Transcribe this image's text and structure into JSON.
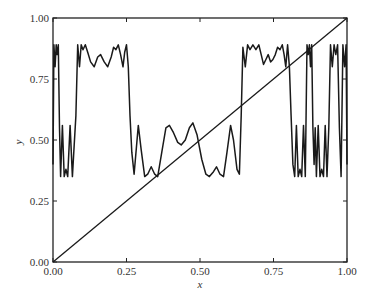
{
  "chart_data": {
    "type": "line",
    "title": "",
    "xlabel": "x",
    "ylabel": "y",
    "xlim": [
      0,
      1
    ],
    "ylim": [
      0,
      1
    ],
    "grid": false,
    "legend": null,
    "x_ticks": [
      "0.00",
      "0.25",
      "0.50",
      "0.75",
      "1.00"
    ],
    "y_ticks": [
      "0.00",
      "0.25",
      "0.50",
      "0.75",
      "1.00"
    ],
    "series": [
      {
        "name": "diagonal y = x",
        "points": [
          [
            0,
            0
          ],
          [
            1,
            1
          ]
        ]
      },
      {
        "name": "oscillating map (Fourier partial sum)",
        "points": [
          [
            0.0,
            0.4
          ],
          [
            0.003,
            0.89
          ],
          [
            0.007,
            0.8
          ],
          [
            0.011,
            0.89
          ],
          [
            0.014,
            0.85
          ],
          [
            0.018,
            0.89
          ],
          [
            0.022,
            0.55
          ],
          [
            0.026,
            0.35
          ],
          [
            0.032,
            0.56
          ],
          [
            0.038,
            0.35
          ],
          [
            0.044,
            0.38
          ],
          [
            0.05,
            0.35
          ],
          [
            0.058,
            0.56
          ],
          [
            0.066,
            0.35
          ],
          [
            0.072,
            0.48
          ],
          [
            0.078,
            0.6
          ],
          [
            0.084,
            0.89
          ],
          [
            0.09,
            0.8
          ],
          [
            0.096,
            0.89
          ],
          [
            0.102,
            0.87
          ],
          [
            0.11,
            0.89
          ],
          [
            0.118,
            0.86
          ],
          [
            0.128,
            0.82
          ],
          [
            0.14,
            0.8
          ],
          [
            0.152,
            0.84
          ],
          [
            0.162,
            0.85
          ],
          [
            0.174,
            0.82
          ],
          [
            0.186,
            0.8
          ],
          [
            0.198,
            0.84
          ],
          [
            0.206,
            0.88
          ],
          [
            0.214,
            0.87
          ],
          [
            0.222,
            0.89
          ],
          [
            0.23,
            0.85
          ],
          [
            0.238,
            0.8
          ],
          [
            0.244,
            0.86
          ],
          [
            0.25,
            0.89
          ],
          [
            0.256,
            0.8
          ],
          [
            0.262,
            0.6
          ],
          [
            0.268,
            0.45
          ],
          [
            0.276,
            0.36
          ],
          [
            0.29,
            0.56
          ],
          [
            0.3,
            0.46
          ],
          [
            0.312,
            0.35
          ],
          [
            0.322,
            0.36
          ],
          [
            0.334,
            0.39
          ],
          [
            0.346,
            0.36
          ],
          [
            0.356,
            0.35
          ],
          [
            0.37,
            0.45
          ],
          [
            0.384,
            0.55
          ],
          [
            0.396,
            0.56
          ],
          [
            0.41,
            0.53
          ],
          [
            0.424,
            0.49
          ],
          [
            0.436,
            0.48
          ],
          [
            0.45,
            0.5
          ],
          [
            0.464,
            0.55
          ],
          [
            0.476,
            0.57
          ],
          [
            0.49,
            0.52
          ],
          [
            0.506,
            0.42
          ],
          [
            0.52,
            0.36
          ],
          [
            0.532,
            0.35
          ],
          [
            0.546,
            0.37
          ],
          [
            0.556,
            0.39
          ],
          [
            0.568,
            0.36
          ],
          [
            0.58,
            0.35
          ],
          [
            0.592,
            0.45
          ],
          [
            0.604,
            0.56
          ],
          [
            0.614,
            0.5
          ],
          [
            0.626,
            0.38
          ],
          [
            0.634,
            0.36
          ],
          [
            0.64,
            0.6
          ],
          [
            0.646,
            0.88
          ],
          [
            0.654,
            0.8
          ],
          [
            0.662,
            0.89
          ],
          [
            0.67,
            0.87
          ],
          [
            0.68,
            0.89
          ],
          [
            0.69,
            0.87
          ],
          [
            0.7,
            0.89
          ],
          [
            0.708,
            0.85
          ],
          [
            0.716,
            0.81
          ],
          [
            0.724,
            0.83
          ],
          [
            0.732,
            0.85
          ],
          [
            0.74,
            0.82
          ],
          [
            0.748,
            0.83
          ],
          [
            0.756,
            0.85
          ],
          [
            0.764,
            0.88
          ],
          [
            0.772,
            0.87
          ],
          [
            0.78,
            0.89
          ],
          [
            0.786,
            0.85
          ],
          [
            0.792,
            0.8
          ],
          [
            0.798,
            0.89
          ],
          [
            0.804,
            0.8
          ],
          [
            0.81,
            0.6
          ],
          [
            0.816,
            0.4
          ],
          [
            0.822,
            0.35
          ],
          [
            0.828,
            0.56
          ],
          [
            0.834,
            0.35
          ],
          [
            0.84,
            0.38
          ],
          [
            0.846,
            0.35
          ],
          [
            0.852,
            0.56
          ],
          [
            0.858,
            0.35
          ],
          [
            0.864,
            0.89
          ],
          [
            0.868,
            0.85
          ],
          [
            0.872,
            0.89
          ],
          [
            0.876,
            0.8
          ],
          [
            0.88,
            0.89
          ],
          [
            0.884,
            0.55
          ],
          [
            0.888,
            0.4
          ]
        ]
      }
    ]
  },
  "plot_area": {
    "left": 53,
    "top": 18,
    "right": 347,
    "bottom": 262
  },
  "colors": {
    "line": "#1a1a1a",
    "axis": "#222222",
    "background": "#ffffff"
  }
}
